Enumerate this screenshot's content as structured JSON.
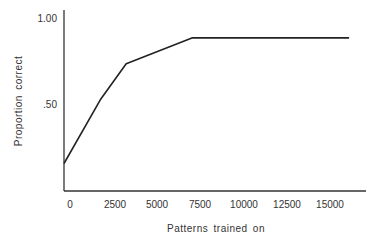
{
  "chart_data": {
    "type": "line",
    "title": "",
    "xlabel": "Patterns trained on",
    "ylabel": "Proportion correct",
    "xlim": [
      0,
      16500
    ],
    "ylim": [
      0,
      1.05
    ],
    "grid": false,
    "legend": null,
    "x_ticks": [
      "0",
      "2500",
      "5000",
      "7500",
      "10000",
      "12500",
      "15000"
    ],
    "y_ticks": [
      "1.00",
      ".50"
    ],
    "series": [
      {
        "name": "Proportion correct",
        "x": [
          0,
          2100,
          3600,
          7400,
          16500
        ],
        "y": [
          0.16,
          0.53,
          0.74,
          0.89,
          0.89
        ]
      }
    ]
  }
}
